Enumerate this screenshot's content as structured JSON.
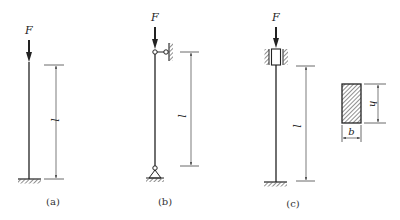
{
  "figure": {
    "panels": [
      {
        "id": "a",
        "caption": "(a)",
        "load_label": "F",
        "length_label": "l",
        "top_support": "free",
        "bottom_support": "fixed"
      },
      {
        "id": "b",
        "caption": "(b)",
        "load_label": "F",
        "length_label": "l",
        "top_support": "pin-roller",
        "bottom_support": "pin"
      },
      {
        "id": "c",
        "caption": "(c)",
        "load_label": "F",
        "length_label": "l",
        "top_support": "guided-slider",
        "bottom_support": "fixed"
      }
    ],
    "cross_section": {
      "shape": "rectangle",
      "width_label": "b",
      "height_label": "h"
    }
  },
  "colors": {
    "stroke": "#222222",
    "dim": "#444444",
    "background": "#ffffff"
  }
}
